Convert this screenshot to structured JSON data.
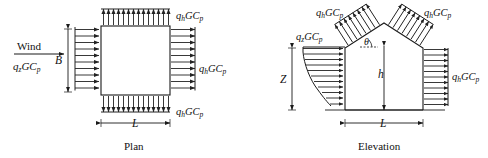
{
  "figure": {
    "background_color": "#ffffff",
    "line_color": "#1a1a1a",
    "arrow_color": "#222222"
  },
  "plan": {
    "caption": "Plan",
    "wind_label": "Wind",
    "windward_pressure": "q₂GCₚ",
    "windward_pressure_parts": {
      "q": "q",
      "sub": "z",
      "gc": "GC",
      "gsub": "p"
    },
    "dimension_b": "B",
    "dimension_l": "L",
    "leeward_label_right": "qₕGCₚ",
    "leeward_label_top": "qₕGCₚ",
    "leeward_label_bottom": "qₕGCₚ",
    "arrow_counts": {
      "left_wall": 10,
      "right_wall": 10,
      "top_wall": 14,
      "bottom_wall": 14
    }
  },
  "elevation": {
    "caption": "Elevation",
    "windward_pressure": "q₂GCₚ",
    "roof_label_left": "qₕGCₚ",
    "roof_label_right": "qₕGCₚ",
    "wall_label_right": "qₕGCₚ",
    "dimension_z": "Z",
    "dimension_h": "h",
    "dimension_l": "L",
    "angle_label": "θ",
    "arrow_counts": {
      "left_wall": 11,
      "right_wall": 11,
      "roof_left": 8,
      "roof_right": 8
    },
    "left_wall_profile": "tapered"
  },
  "symbols": {
    "q": "q",
    "sub_z": "z",
    "sub_h": "h",
    "GC": "GC",
    "sub_p": "p",
    "theta": "θ"
  }
}
